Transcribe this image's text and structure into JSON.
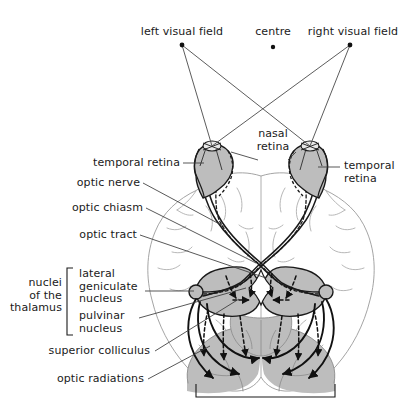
{
  "figure": {
    "background_color": "#ffffff",
    "ink_color": "#1a1a1a",
    "shade_color": "#bdbdbd",
    "shade_color_dark": "#a8a8a8",
    "outline_color": "#8c8c8c"
  },
  "labels": {
    "left_visual_field": "left visual field",
    "centre": "centre",
    "right_visual_field": "right visual field",
    "nasal_retina": "nasal\nretina",
    "temporal_retina_left": "temporal retina",
    "temporal_retina_right": "temporal\nretina",
    "optic_nerve": "optic nerve",
    "optic_chiasm": "optic chiasm",
    "optic_tract": "optic tract",
    "nuclei_of_the_thalamus": "nuclei\nof the\nthalamus",
    "lateral_geniculate_nucleus": "lateral\ngeniculate\nnucleus",
    "pulvinar_nucleus": "pulvinar\nnucleus",
    "superior_colliculus": "superior colliculus",
    "optic_radiations": "optic radiations"
  },
  "markers": {
    "left_field_dot": "left-field-point",
    "centre_dot": "centre-fixation-point",
    "right_field_dot": "right-field-point"
  },
  "structures": {
    "left_eye": "left-eye",
    "right_eye": "right-eye",
    "chiasm": "optic-chiasm-crossing",
    "thalamus": "thalamic-nuclei-body",
    "left_occipital": "left-occipital-lobe",
    "right_occipital": "right-occipital-lobe",
    "brain_outline": "cerebral-hemispheres-outline",
    "visual_cortex_bracket": "visual-cortex-bracket",
    "thalamus_bracket": "thalamus-label-bracket"
  }
}
